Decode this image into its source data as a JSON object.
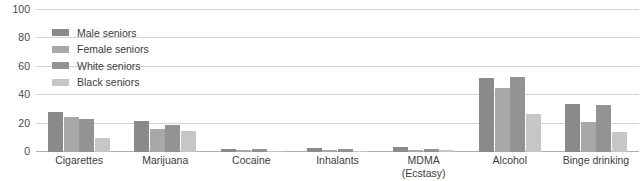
{
  "top_fragment": "",
  "legend": {
    "position": "inside-top-left",
    "entries": [
      {
        "label": "Male seniors",
        "color": "#8a8a8a"
      },
      {
        "label": "Female seniors",
        "color": "#a8a8a8"
      },
      {
        "label": "White seniors",
        "color": "#939393"
      },
      {
        "label": "Black seniors",
        "color": "#c6c6c6"
      }
    ]
  },
  "chart_data": {
    "type": "bar",
    "title": "",
    "xlabel": "",
    "ylabel": "",
    "ylim": [
      0,
      100
    ],
    "yticks": [
      0,
      20,
      40,
      60,
      80,
      100
    ],
    "ticklabels": [
      "0",
      "20",
      "40",
      "60",
      "80",
      "100"
    ],
    "grid": true,
    "categories": [
      "Cigarettes",
      "Marijuana",
      "Cocaine",
      "Inhalants",
      "MDMA (Ecstasy)",
      "Alcohol",
      "Binge drinking"
    ],
    "category_lines": [
      [
        "Cigarettes"
      ],
      [
        "Marijuana"
      ],
      [
        "Cocaine"
      ],
      [
        "Inhalants"
      ],
      [
        "MDMA",
        "(Ecstasy)"
      ],
      [
        "Alcohol"
      ],
      [
        "Binge drinking"
      ]
    ],
    "series": [
      {
        "name": "Male seniors",
        "color": "#8a8a8a",
        "values": [
          28,
          22,
          2.2,
          2.6,
          3.2,
          52,
          34
        ]
      },
      {
        "name": "Female seniors",
        "color": "#a8a8a8",
        "values": [
          25,
          16,
          1.2,
          1.2,
          1.4,
          45,
          21
        ]
      },
      {
        "name": "White seniors",
        "color": "#939393",
        "values": [
          23,
          19,
          1.8,
          2.0,
          2.2,
          53,
          33
        ]
      },
      {
        "name": "Black seniors",
        "color": "#c6c6c6",
        "values": [
          10,
          15,
          0.6,
          1.0,
          1.2,
          27,
          14
        ]
      }
    ]
  }
}
